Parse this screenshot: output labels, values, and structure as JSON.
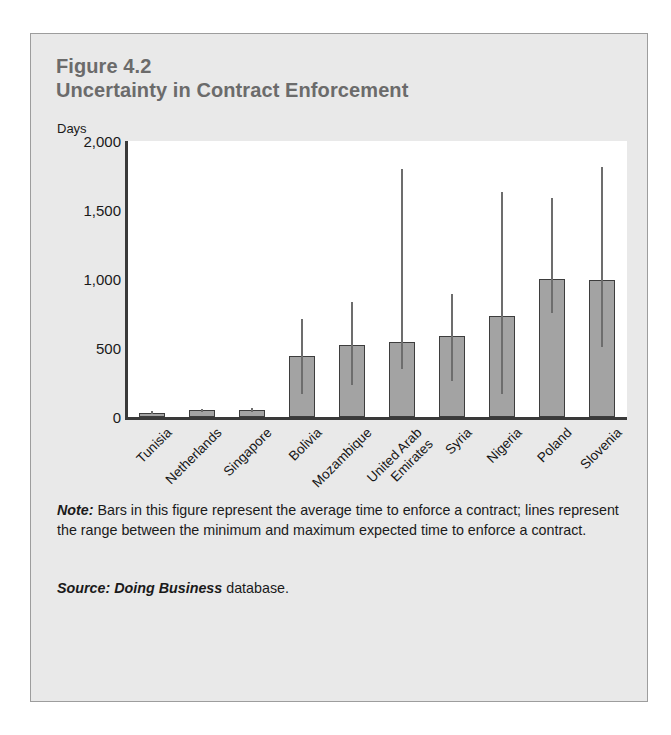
{
  "figure": {
    "number_line": "Figure 4.2",
    "title_line": "Uncertainty in Contract Enforcement",
    "unit_label": "Days",
    "note_lead": "Note:",
    "note_text": " Bars in this figure represent the average time to enforce a contract; lines represent the range between the minimum and maximum expected time to enforce a contract.",
    "source_lead": "Source:",
    "source_italic": " Doing Business",
    "source_tail": " database."
  },
  "colors": {
    "page_background": "#ffffff",
    "panel_background": "#e9e9e9",
    "panel_border": "#9d9d9d",
    "plot_background": "#ffffff",
    "bar_fill": "#a3a3a3",
    "bar_stroke": "#3d3d3d",
    "range_line": "#6d6d6d",
    "axis": "#3a3a3a",
    "title_text": "#6b6b6b",
    "body_text": "#1a1a1a"
  },
  "chart_data": {
    "type": "bar",
    "title": "Uncertainty in Contract Enforcement",
    "subtitle": "Figure 4.2",
    "xlabel": "",
    "ylabel": "Days",
    "ylim": [
      0,
      2000
    ],
    "yticks": [
      0,
      500,
      1000,
      1500,
      2000
    ],
    "ytick_labels": [
      "0",
      "500",
      "1,000",
      "1,500",
      "2,000"
    ],
    "grid": false,
    "legend": false,
    "categories": [
      "Tunisia",
      "Netherlands",
      "Singapore",
      "Bolivia",
      "Mozambique",
      "United Arab\nEmirates",
      "Syria",
      "Nigeria",
      "Poland",
      "Slovenia"
    ],
    "series": [
      {
        "name": "Average time to enforce a contract (days)",
        "values": [
          27,
          48,
          50,
          440,
          525,
          545,
          585,
          730,
          1000,
          990
        ]
      }
    ],
    "range_min": [
      20,
      35,
      38,
      170,
      235,
      350,
      260,
      170,
      755,
      510
    ],
    "range_max": [
      40,
      60,
      65,
      710,
      835,
      1800,
      890,
      1630,
      1590,
      1810
    ],
    "error_bars": {
      "description": "lines represent the range between the minimum and maximum expected time to enforce a contract"
    }
  }
}
